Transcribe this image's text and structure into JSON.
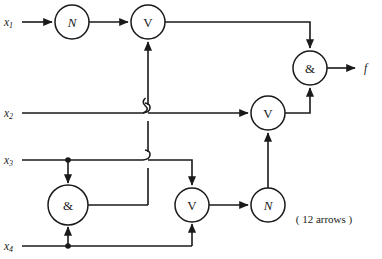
{
  "diagram": {
    "annotation": "( 12 arrows )",
    "inputs": [
      {
        "id": "x1",
        "label": "x",
        "subscript": "1",
        "y": 22
      },
      {
        "id": "x2",
        "label": "x",
        "subscript": "2",
        "y": 113
      },
      {
        "id": "x3",
        "label": "x",
        "subscript": "3",
        "y": 160
      },
      {
        "id": "x4",
        "label": "x",
        "subscript": "4",
        "y": 246
      }
    ],
    "outputs": [
      {
        "id": "f",
        "label": "f",
        "y": 68
      }
    ],
    "gates": [
      {
        "id": "gate-n-top",
        "symbol": "N",
        "type": "not",
        "x": 72,
        "y": 22,
        "r": 17,
        "italic": true
      },
      {
        "id": "gate-v-top",
        "symbol": "V",
        "type": "or",
        "x": 148,
        "y": 22,
        "r": 17,
        "italic": false
      },
      {
        "id": "gate-and-out",
        "symbol": "&",
        "type": "and",
        "x": 310,
        "y": 68,
        "r": 17,
        "italic": false
      },
      {
        "id": "gate-v-mid",
        "symbol": "V",
        "type": "or",
        "x": 268,
        "y": 113,
        "r": 17,
        "italic": false
      },
      {
        "id": "gate-and-low",
        "symbol": "&",
        "type": "and",
        "x": 68,
        "y": 205,
        "r": 20,
        "italic": false
      },
      {
        "id": "gate-v-low",
        "symbol": "V",
        "type": "or",
        "x": 192,
        "y": 205,
        "r": 17,
        "italic": false
      },
      {
        "id": "gate-n-low",
        "symbol": "N",
        "type": "not",
        "x": 268,
        "y": 205,
        "r": 17,
        "italic": true
      }
    ],
    "colors": {
      "wire": "#1a1a1a",
      "gate_fill": "#ffffff",
      "background": "#ffffff"
    },
    "arrow_count": 12
  }
}
